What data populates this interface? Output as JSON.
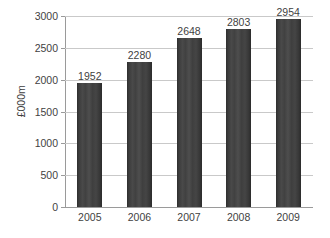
{
  "chart_data": {
    "type": "bar",
    "title": "",
    "subtitle": "",
    "xlabel": "",
    "ylabel": "£000m",
    "categories": [
      "2005",
      "2006",
      "2007",
      "2008",
      "2009"
    ],
    "values": [
      1952,
      2280,
      2648,
      2803,
      2954
    ],
    "data_labels": [
      "1952",
      "2280",
      "2648",
      "2803",
      "2954"
    ],
    "series": [
      {
        "name": "",
        "values": [
          1952,
          2280,
          2648,
          2803,
          2954
        ]
      }
    ],
    "ylim": [
      0,
      3000
    ],
    "y_ticks": [
      0,
      500,
      1000,
      1500,
      2000,
      2500,
      3000
    ],
    "y_tick_labels": [
      "0",
      "500",
      "1000",
      "1500",
      "2000",
      "2500",
      "3000"
    ],
    "grid": true,
    "grid_axis": "y",
    "legend": false,
    "legend_position": "none",
    "annotations": [],
    "colors": {
      "bar": "#3b3b3b",
      "gridline": "#c9c9c9",
      "axis": "#9a9a9a",
      "text": "#3f3f3f",
      "background": "#ffffff"
    }
  }
}
